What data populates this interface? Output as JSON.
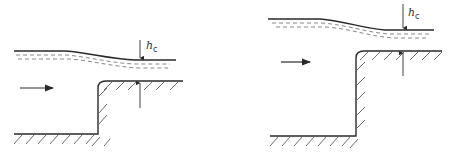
{
  "diagram": {
    "panels": [
      {
        "id": "left",
        "label_main": "h",
        "label_sub": "c",
        "description": "Low step: free surface drops to critical depth over the step crest"
      },
      {
        "id": "right",
        "label_main": "h",
        "label_sub": "c",
        "description": "High step: free surface drops to critical depth over the step crest"
      }
    ],
    "colors": {
      "line": "#2a2a2a",
      "hatch": "#444444",
      "background": "#ffffff"
    }
  }
}
